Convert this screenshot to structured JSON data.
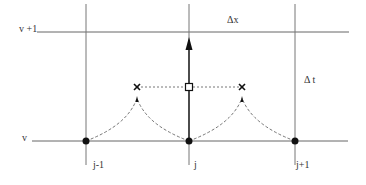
{
  "diagram": {
    "type": "finite-difference stencil",
    "time_levels": [
      {
        "label": "v +1",
        "y": 32
      },
      {
        "label": "v",
        "y": 141
      }
    ],
    "grid_columns": [
      {
        "label": "j-1",
        "x": 86
      },
      {
        "label": "j",
        "x": 189
      },
      {
        "label": "j+1",
        "x": 295
      }
    ],
    "spacing_labels": {
      "dx": "Δx",
      "dt": "Δ t"
    },
    "markers": {
      "grid_nodes": [
        "j-1",
        "j",
        "j+1"
      ],
      "intermediate_points": [
        "cross-left",
        "cross-right"
      ],
      "center_point": "square"
    },
    "colors": {
      "line": "#555555",
      "marker": "#111111",
      "dashed": "#555555"
    }
  }
}
